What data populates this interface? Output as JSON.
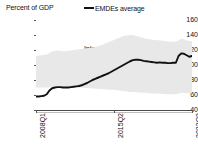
{
  "chart_data": {
    "type": "line",
    "title": "",
    "ylabel": "Percent of GDP",
    "xlabel": "",
    "ylim": [
      40,
      160
    ],
    "yticks": [
      40,
      60,
      80,
      100,
      120,
      140,
      160
    ],
    "ytick_labels": [
      "40",
      "60",
      "80",
      "100",
      "120",
      "140",
      "160"
    ],
    "grid": false,
    "legend_position": "top-center",
    "legend": [
      "Interquartile range",
      "EMDEs average"
    ],
    "xtick_labels": [
      "2008Q1",
      "2015Q2",
      "2022Q3"
    ],
    "xtick_positions": [
      0,
      29,
      58
    ],
    "x": [
      "2008Q1",
      "2008Q2",
      "2008Q3",
      "2008Q4",
      "2009Q1",
      "2009Q2",
      "2009Q3",
      "2009Q4",
      "2010Q1",
      "2010Q2",
      "2010Q3",
      "2010Q4",
      "2011Q1",
      "2011Q2",
      "2011Q3",
      "2011Q4",
      "2012Q1",
      "2012Q2",
      "2012Q3",
      "2012Q4",
      "2013Q1",
      "2013Q2",
      "2013Q3",
      "2013Q4",
      "2014Q1",
      "2014Q2",
      "2014Q3",
      "2014Q4",
      "2015Q1",
      "2015Q2",
      "2015Q3",
      "2015Q4",
      "2016Q1",
      "2016Q2",
      "2016Q3",
      "2016Q4",
      "2017Q1",
      "2017Q2",
      "2017Q3",
      "2017Q4",
      "2018Q1",
      "2018Q2",
      "2018Q3",
      "2018Q4",
      "2019Q1",
      "2019Q2",
      "2019Q3",
      "2019Q4",
      "2020Q1",
      "2020Q2",
      "2020Q3",
      "2020Q4",
      "2021Q1",
      "2021Q2",
      "2021Q3",
      "2021Q4",
      "2022Q1",
      "2022Q2",
      "2022Q3"
    ],
    "series": [
      {
        "name": "EMDEs average",
        "color": "#111111",
        "values": [
          58,
          58,
          58.5,
          59,
          61,
          66,
          69,
          70,
          70.5,
          70.5,
          70,
          70,
          70,
          70.5,
          71,
          71.5,
          72,
          73,
          74.5,
          76,
          78,
          80,
          81.5,
          83,
          84.5,
          86,
          87.5,
          89,
          91,
          93,
          95,
          97,
          99,
          101,
          103,
          105,
          106.5,
          107,
          107,
          106.5,
          105.5,
          105,
          104.5,
          104,
          103.5,
          103,
          103.5,
          103,
          103,
          102.5,
          102.5,
          103,
          103,
          112,
          115.5,
          115,
          113,
          111,
          112
        ]
      },
      {
        "name": "Interquartile range upper",
        "color": "#e6e6e6",
        "values": [
          112,
          112.5,
          113,
          113.5,
          114,
          116,
          118,
          119,
          119,
          119,
          118.5,
          118.5,
          119,
          119.5,
          120,
          120.5,
          121,
          121.5,
          122,
          122.5,
          123,
          123.5,
          124,
          125,
          126,
          127.5,
          129,
          130.5,
          132,
          133.5,
          135,
          136.5,
          138,
          139,
          139.5,
          140,
          140,
          139,
          138,
          137,
          136,
          135,
          134.5,
          134,
          133.5,
          133,
          133,
          132.5,
          132,
          131.5,
          131,
          131,
          131,
          133,
          135,
          134.5,
          133,
          132,
          132
        ]
      },
      {
        "name": "Interquartile range lower",
        "color": "#e6e6e6",
        "values": [
          70,
          70,
          70,
          70,
          70,
          70.5,
          71,
          71.5,
          71.5,
          71.5,
          71,
          71,
          70.5,
          70.5,
          70.5,
          70.5,
          70,
          70,
          69.5,
          69.5,
          69,
          69,
          68.5,
          68.5,
          68,
          68,
          67.5,
          67.5,
          67,
          67,
          66.5,
          66,
          65.5,
          65,
          64.5,
          64,
          64,
          64,
          63.5,
          63.5,
          63,
          63,
          62.5,
          62.5,
          62,
          62,
          62,
          61.5,
          61.5,
          61,
          61,
          61,
          61,
          62,
          63,
          63,
          62.5,
          62.5,
          62.5
        ]
      }
    ]
  },
  "colors": {
    "line": "#111111",
    "band": "#e8e8e8",
    "axis": "#4a4a4a",
    "text": "#111111"
  }
}
